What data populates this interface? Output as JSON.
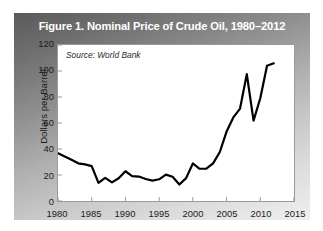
{
  "figure": {
    "title": "Figure 1. Nominal Price of Crude Oil, 1980–2012",
    "source_note": "Source: World Bank",
    "panel_gradient_from": "#5a5a5a",
    "panel_gradient_to": "#efefef",
    "title_color": "#ffffff",
    "plot_background": "#ffffff",
    "line_color": "#000000"
  },
  "chart_data": {
    "type": "line",
    "title": "Figure 1. Nominal Price of Crude Oil, 1980–2012",
    "xlabel": "",
    "ylabel": "Dollars per Barrel",
    "xlim": [
      1980,
      2015
    ],
    "ylim": [
      0,
      120
    ],
    "xticks": [
      1980,
      1985,
      1990,
      1995,
      2000,
      2005,
      2010,
      2015
    ],
    "yticks": [
      0,
      20,
      40,
      60,
      80,
      100,
      120
    ],
    "grid": false,
    "legend": null,
    "annotations": [
      "Source: World Bank"
    ],
    "x": [
      1980,
      1981,
      1982,
      1983,
      1984,
      1985,
      1986,
      1987,
      1988,
      1989,
      1990,
      1991,
      1992,
      1993,
      1994,
      1995,
      1996,
      1997,
      1998,
      1999,
      2000,
      2001,
      2002,
      2003,
      2004,
      2005,
      2006,
      2007,
      2008,
      2009,
      2010,
      2011,
      2012
    ],
    "series": [
      {
        "name": "Nominal Price of Crude Oil",
        "values": [
          36.8,
          34.3,
          31.8,
          29.0,
          28.2,
          26.8,
          14.0,
          17.8,
          14.3,
          17.5,
          22.9,
          19.2,
          18.8,
          16.9,
          15.7,
          16.7,
          20.3,
          18.7,
          12.7,
          17.6,
          28.9,
          24.8,
          24.9,
          28.9,
          37.7,
          53.4,
          64.3,
          71.1,
          97.6,
          61.8,
          79.0,
          104.0,
          105.9
        ]
      }
    ]
  }
}
